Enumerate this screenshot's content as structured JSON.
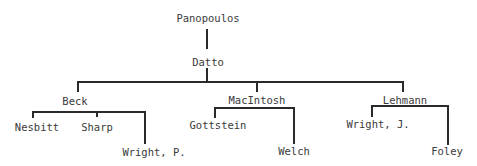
{
  "diagram": {
    "type": "tree",
    "root": "Panopoulos",
    "nodes": {
      "panopoulos": "Panopoulos",
      "datto": "Datto",
      "beck": "Beck",
      "macintosh": "MacIntosh",
      "lehmann": "Lehmann",
      "nesbitt": "Nesbitt",
      "sharp": "Sharp",
      "wright_p": "Wright, P.",
      "gottstein": "Gottstein",
      "welch": "Welch",
      "wright_j": "Wright, J.",
      "foley": "Foley"
    },
    "edges": [
      [
        "Panopoulos",
        "Datto"
      ],
      [
        "Datto",
        "Beck"
      ],
      [
        "Datto",
        "MacIntosh"
      ],
      [
        "Datto",
        "Lehmann"
      ],
      [
        "Beck",
        "Nesbitt"
      ],
      [
        "Beck",
        "Sharp"
      ],
      [
        "Beck",
        "Wright, P."
      ],
      [
        "MacIntosh",
        "Gottstein"
      ],
      [
        "MacIntosh",
        "Welch"
      ],
      [
        "Lehmann",
        "Wright, J."
      ],
      [
        "Lehmann",
        "Foley"
      ]
    ]
  }
}
